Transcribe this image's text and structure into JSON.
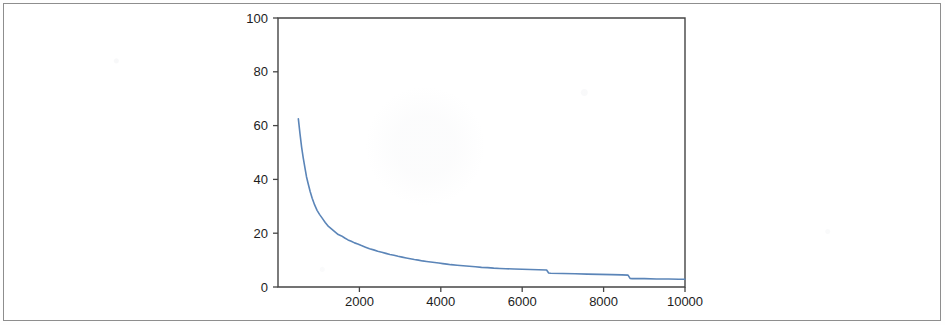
{
  "figure": {
    "background_color": "#ffffff",
    "border_color": "#8e8e8e",
    "axis_color": "#454545",
    "tick_label_color": "#1d1d1d"
  },
  "chart_data": {
    "type": "line",
    "title": "",
    "subtitle": "",
    "xlabel": "",
    "ylabel": "",
    "xlim": [
      0,
      10000
    ],
    "ylim": [
      0,
      100
    ],
    "grid": false,
    "legend": null,
    "legend_position": "none",
    "annotations": [],
    "xticks": [
      2000,
      4000,
      6000,
      8000,
      10000
    ],
    "xtick_labels": [
      "2000",
      "4000",
      "6000",
      "8000",
      "10000"
    ],
    "yticks": [
      0,
      20,
      40,
      60,
      80,
      100
    ],
    "ytick_labels": [
      "0",
      "20",
      "40",
      "60",
      "80",
      "100"
    ],
    "series": [
      {
        "name": "decay",
        "color": "#5b85b8",
        "line_width": 1.6,
        "x": [
          500,
          540,
          580,
          620,
          660,
          700,
          740,
          790,
          840,
          900,
          960,
          1020,
          1090,
          1160,
          1240,
          1320,
          1400,
          1480,
          1560,
          1640,
          1720,
          1800,
          1880,
          1960,
          2050,
          2150,
          2250,
          2350,
          2450,
          2550,
          2650,
          2750,
          2850,
          2950,
          3050,
          3150,
          3250,
          3350,
          3450,
          3550,
          3650,
          3750,
          3850,
          3950,
          4050,
          4150,
          4250,
          4400,
          4550,
          4700,
          4850,
          5000,
          5150,
          5300,
          5450,
          5600,
          5800,
          6000,
          6200,
          6400,
          6600,
          6650,
          6700,
          7000,
          7300,
          7600,
          7900,
          8200,
          8450,
          8600,
          8650,
          8700,
          9000,
          9300,
          9600,
          9850,
          10000
        ],
        "y": [
          62.5,
          57.0,
          52.0,
          48.0,
          44.5,
          41.0,
          38.5,
          35.5,
          33.0,
          30.5,
          28.5,
          27.0,
          25.5,
          24.0,
          22.5,
          21.5,
          20.5,
          19.5,
          19.0,
          18.2,
          17.5,
          17.0,
          16.4,
          16.0,
          15.4,
          14.8,
          14.2,
          13.8,
          13.3,
          12.9,
          12.5,
          12.1,
          11.8,
          11.4,
          11.1,
          10.8,
          10.5,
          10.2,
          10.0,
          9.7,
          9.5,
          9.3,
          9.1,
          8.9,
          8.7,
          8.5,
          8.3,
          8.1,
          7.9,
          7.7,
          7.5,
          7.3,
          7.2,
          7.0,
          6.9,
          6.8,
          6.7,
          6.6,
          6.5,
          6.4,
          6.3,
          5.2,
          5.1,
          5.0,
          4.9,
          4.8,
          4.7,
          4.6,
          4.5,
          4.4,
          3.2,
          3.1,
          3.1,
          3.0,
          3.0,
          2.9,
          2.9
        ]
      }
    ]
  }
}
